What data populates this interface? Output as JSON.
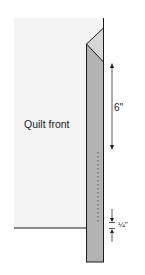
{
  "diagram": {
    "labels": {
      "quilt_front": "Quilt front",
      "six_inch": "6\"",
      "quarter_inch": "¼\""
    },
    "colors": {
      "quilt_fill": "#f4f4f4",
      "strip_fill": "#b3b3b3",
      "fold_fill": "#d6d6d6",
      "line": "#1a1a1a",
      "stitch": "#5a5a5a"
    },
    "dimensions": [
      {
        "name": "fold-length",
        "value": "6\""
      },
      {
        "name": "seam-allowance",
        "value": "¼\""
      }
    ]
  }
}
